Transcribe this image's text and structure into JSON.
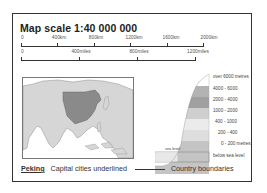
{
  "title": "Map scale 1:40 000 000",
  "scale_km": {
    "labels": [
      "0",
      "400km",
      "800km",
      "1200km",
      "1600km",
      "2000km"
    ]
  },
  "scale_miles": {
    "labels": [
      "0",
      "400miles",
      "800miles",
      "1200miles"
    ]
  },
  "map": {
    "region": "Asia",
    "highlighted_country": "China",
    "highlight_color": "#8a8a8a",
    "land_color": "#d6d6d6",
    "sea_color": "#ffffff"
  },
  "elevation_legend": {
    "sea_level_label": "sea level",
    "bands": [
      {
        "label": "over 6000 metres",
        "color": "#ffffff"
      },
      {
        "label": "4000 - 6000",
        "color": "#b3b3b3"
      },
      {
        "label": "2000 - 4000",
        "color": "#a0a0a0"
      },
      {
        "label": "1000 - 2000",
        "color": "#cfcfcf"
      },
      {
        "label": "400 - 1000",
        "color": "#ebebeb"
      },
      {
        "label": "200 - 400",
        "color": "#dedede"
      },
      {
        "label": "0 - 200 metres",
        "color": "#c4c4c4"
      },
      {
        "label": "below sea level",
        "color": "#e8e8e8"
      }
    ]
  },
  "footer": {
    "capital_example": "Peking",
    "capital_note": "Capital cities underlined",
    "boundary_note": "Country boundaries"
  }
}
